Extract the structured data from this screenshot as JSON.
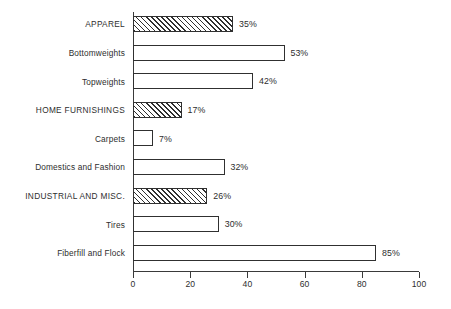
{
  "chart_data": {
    "type": "bar",
    "orientation": "horizontal",
    "title": "",
    "xlabel": "",
    "ylabel": "",
    "xlim": [
      0,
      100
    ],
    "xticks": [
      0,
      20,
      40,
      60,
      80,
      100
    ],
    "xtick_labels": [
      "0",
      "20",
      "40",
      "60",
      "80",
      "100"
    ],
    "grid": false,
    "legend": "none",
    "value_suffix": "%",
    "categories": [
      "APPAREL",
      "Bottomweights",
      "Topweights",
      "HOME FURNISHINGS",
      "Carpets",
      "Domestics and Fashion",
      "INDUSTRIAL AND MISC.",
      "Tires",
      "Fiberfill and Flock"
    ],
    "values": [
      35,
      53,
      42,
      17,
      7,
      32,
      26,
      30,
      85
    ],
    "value_labels": [
      "35%",
      "53%",
      "42%",
      "17%",
      "7%",
      "32%",
      "26%",
      "30%",
      "85%"
    ],
    "is_header": [
      true,
      false,
      false,
      true,
      false,
      false,
      true,
      false,
      false
    ],
    "fill_styles": [
      "hatched",
      "open",
      "open",
      "hatched",
      "open",
      "open",
      "hatched",
      "open",
      "open"
    ],
    "colors": {
      "bar_outline": "#303030",
      "bar_open_fill": "#ffffff",
      "bar_hatch_line": "#2f2f2f",
      "axis": "#3a3a3a",
      "text": "#2e2e2e",
      "background": "#ffffff"
    }
  }
}
